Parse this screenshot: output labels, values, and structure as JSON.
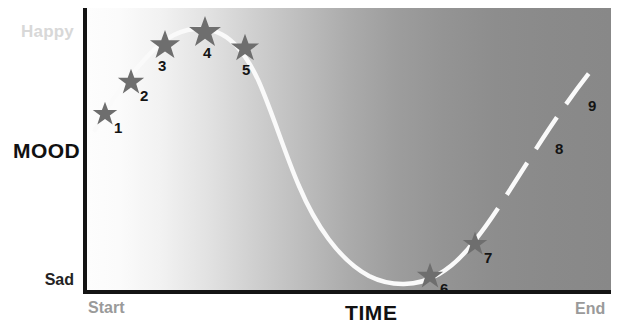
{
  "figure": {
    "background_color": "#ffffff",
    "plot_gradient_from": "#fdfdfd",
    "plot_gradient_to": "#888888",
    "axis_color": "#141414",
    "curve_color": "#fafafa",
    "star_color": "#6e6e6e",
    "number_color": "#141414"
  },
  "axes": {
    "y_axis_name": "MOOD",
    "y_top_label": "Happy",
    "y_bottom_label": "Sad",
    "x_axis_name": "TIME",
    "x_start_label": "Start",
    "x_end_label": "End",
    "y_top_label_color": "#d8d8d8",
    "y_bottom_label_color": "#232323",
    "x_start_label_color": "#9a9a9a",
    "x_end_label_color": "#9a9a9a"
  },
  "chart_data": {
    "type": "line",
    "title": "",
    "subtitle": "",
    "xlabel": "TIME",
    "ylabel": "MOOD",
    "x_tick_labels": [
      "Start",
      "End"
    ],
    "y_tick_labels": [
      "Sad",
      "Happy"
    ],
    "xlim": [
      0,
      100
    ],
    "ylim": [
      0,
      100
    ],
    "grid": false,
    "legend": false,
    "legend_position": "none",
    "annotations": [
      "Curve rises from Start to a peak near point 4, falls to a trough at point 6, then rises again toward End.",
      "Solid line covers points 1 through 7; the segment beyond point 7 (points 8 and 9) is drawn as a dashed line."
    ],
    "series": [
      {
        "name": "Mood",
        "line_style_solid_through_point": 7,
        "line_style_after": "dashed",
        "x": [
          3,
          9,
          16,
          23,
          31,
          66,
          74,
          86,
          95
        ],
        "y": [
          62,
          76,
          89,
          95,
          88,
          6,
          18,
          52,
          75
        ]
      }
    ],
    "points": [
      {
        "id": 1,
        "label": "1",
        "marker": "star",
        "x_px": 104,
        "y_px": 114,
        "label_x_px": 114,
        "label_y_px": 120
      },
      {
        "id": 2,
        "label": "2",
        "marker": "star",
        "x_px": 130,
        "y_px": 81,
        "label_x_px": 140,
        "label_y_px": 88
      },
      {
        "id": 3,
        "label": "3",
        "marker": "star",
        "x_px": 165,
        "y_px": 44,
        "label_x_px": 158,
        "label_y_px": 58
      },
      {
        "id": 4,
        "label": "4",
        "marker": "star",
        "x_px": 205,
        "y_px": 31,
        "label_x_px": 203,
        "label_y_px": 45
      },
      {
        "id": 5,
        "label": "5",
        "marker": "star",
        "x_px": 245,
        "y_px": 47,
        "label_x_px": 242,
        "label_y_px": 62
      },
      {
        "id": 6,
        "label": "6",
        "marker": "star",
        "x_px": 429,
        "y_px": 274,
        "label_x_px": 440,
        "label_y_px": 281
      },
      {
        "id": 7,
        "label": "7",
        "marker": "star",
        "x_px": 474,
        "y_px": 243,
        "label_x_px": 484,
        "label_y_px": 250
      },
      {
        "id": 8,
        "label": "8",
        "marker": "dash-only",
        "x_px": 546,
        "y_px": 128,
        "label_x_px": 555,
        "label_y_px": 141
      },
      {
        "id": 9,
        "label": "9",
        "marker": "dash-only",
        "x_px": 578,
        "y_px": 91,
        "label_x_px": 588,
        "label_y_px": 98
      }
    ]
  }
}
